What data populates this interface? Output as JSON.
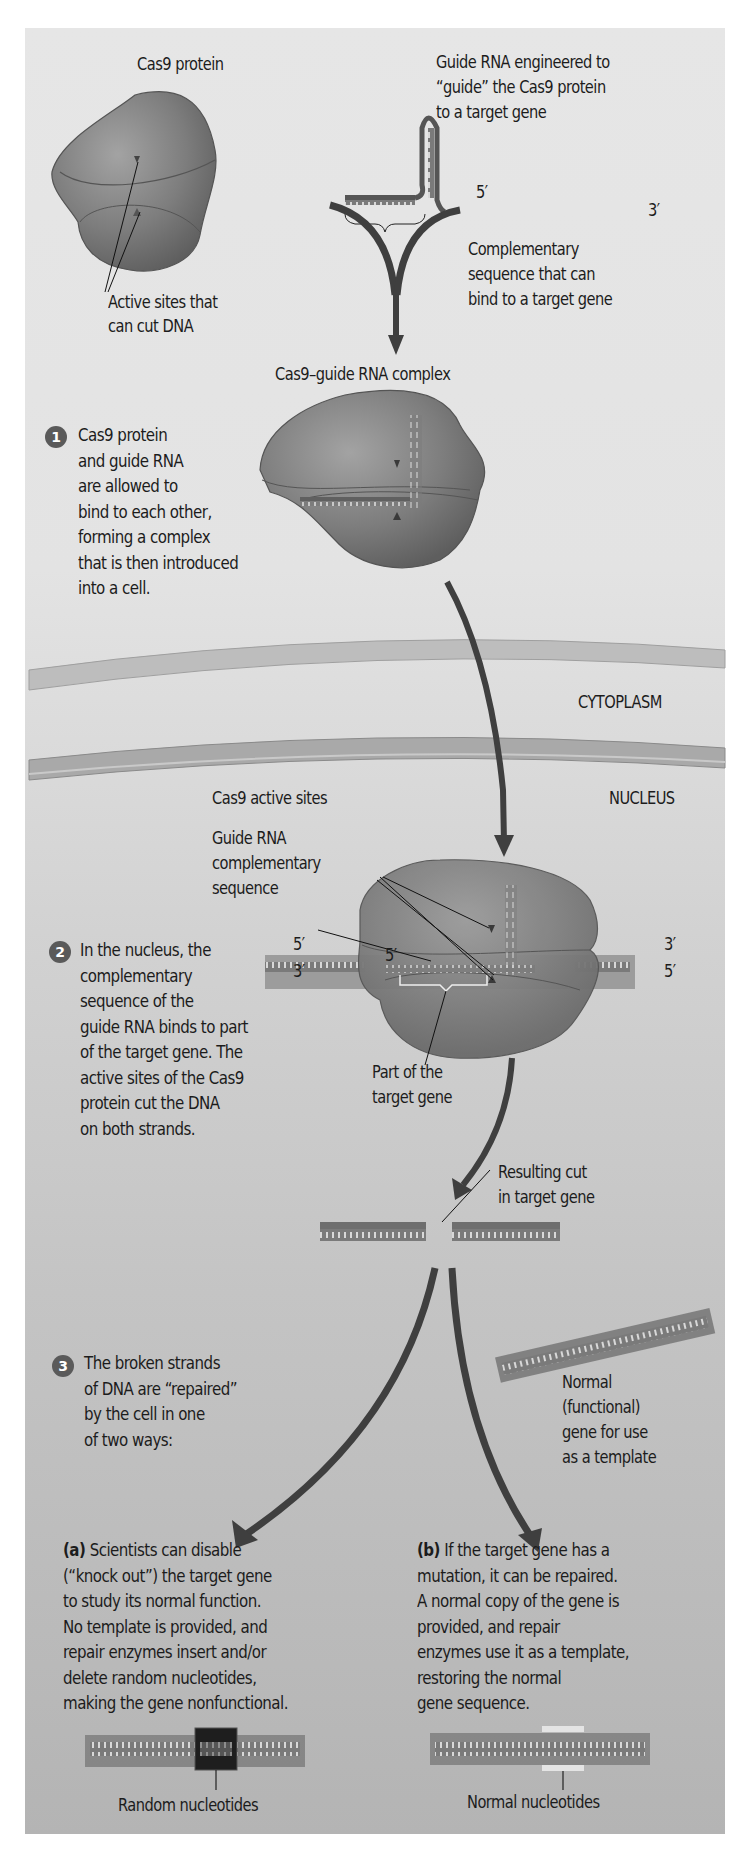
{
  "figure": {
    "top": {
      "cas9_label": "Cas9 protein",
      "guide_rna_label_lines": [
        "Guide RNA engineered to",
        "“guide” the Cas9 protein",
        "to a target gene"
      ],
      "five_prime": "5′",
      "three_prime": "3′",
      "complementary_label_lines": [
        "Complementary",
        "sequence that can",
        "bind to a target gene"
      ],
      "active_sites_label_lines": [
        "Active sites that",
        "can cut DNA"
      ],
      "complex_label": "Cas9–guide RNA complex"
    },
    "step1": {
      "number": "1",
      "text": "Cas9 protein\nand guide RNA\nare allowed to\nbind to each other,\nforming a complex\nthat is then introduced\ninto a cell."
    },
    "regions": {
      "cytoplasm": "CYTOPLASM",
      "nucleus": "NUCLEUS"
    },
    "step2": {
      "number": "2",
      "text": "In the nucleus, the\ncomplementary\nsequence of the\nguide RNA binds to part\nof the target gene. The\nactive sites of the Cas9\nprotein cut the DNA\non both strands.",
      "cas9_active_sites_label": "Cas9 active sites",
      "guide_rna_comp_label_lines": [
        "Guide RNA",
        "complementary",
        "sequence"
      ],
      "left_top_end": "5′",
      "left_bottom_end": "3′",
      "right_top_end": "3′",
      "right_bottom_end": "5′",
      "inner_five_prime": "5′",
      "part_of_target_label_lines": [
        "Part of the",
        "target gene"
      ],
      "resulting_cut_label_lines": [
        "Resulting cut",
        "in target gene"
      ]
    },
    "step3": {
      "number": "3",
      "text": "The broken strands\nof DNA are “repaired”\nby the cell in one\nof two ways:",
      "template_label_lines": [
        "Normal",
        "(functional)",
        "gene for use",
        "as a template"
      ]
    },
    "outcome_a": {
      "tag": "(a)",
      "text": " Scientists can disable\n(“knock out”) the target gene\nto study its normal function.\nNo template is provided, and\nrepair enzymes insert and/or\ndelete random nucleotides,\nmaking the gene nonfunctional.",
      "caption": "Random nucleotides"
    },
    "outcome_b": {
      "tag": "(b)",
      "text": " If the target gene has a\nmutation, it can be repaired.\nA normal copy of the gene is\nprovided, and repair\nenzymes use it as a template,\nrestoring the normal\ngene sequence.",
      "caption": "Normal nucleotides"
    }
  },
  "colors": {
    "protein": "#7a7a7a",
    "protein_light": "#9a9a9a",
    "protein_dark": "#5f5f5f",
    "arrow": "#4a4a4a",
    "membrane": "#b8b8b8",
    "dna": "#7d7d7d",
    "knockout_block": "#1e1e1e",
    "normal_block": "#e4e4e4"
  }
}
